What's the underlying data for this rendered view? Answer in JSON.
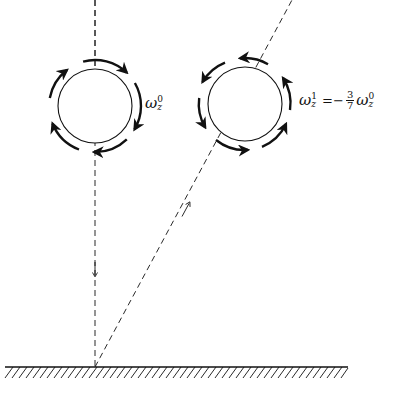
{
  "diagram": {
    "colors": {
      "ink": "#111111",
      "background": "#ffffff"
    },
    "ball_before": {
      "spin_label": {
        "symbol": "ω",
        "subscript": "z",
        "superscript": "0"
      },
      "spin_direction": "clockwise"
    },
    "ball_after": {
      "spin_label": {
        "symbol": "ω",
        "subscript": "z",
        "superscript": "1",
        "equals": "=",
        "sign": "−",
        "numerator": "3",
        "denominator": "7",
        "rhs_symbol": "ω",
        "rhs_subscript": "z",
        "rhs_superscript": "0"
      },
      "spin_direction": "counterclockwise"
    },
    "trajectories": [
      {
        "name": "incident",
        "direction": "down"
      },
      {
        "name": "reflected",
        "direction": "up-right"
      }
    ],
    "surface": {
      "type": "hatched-ground"
    }
  }
}
